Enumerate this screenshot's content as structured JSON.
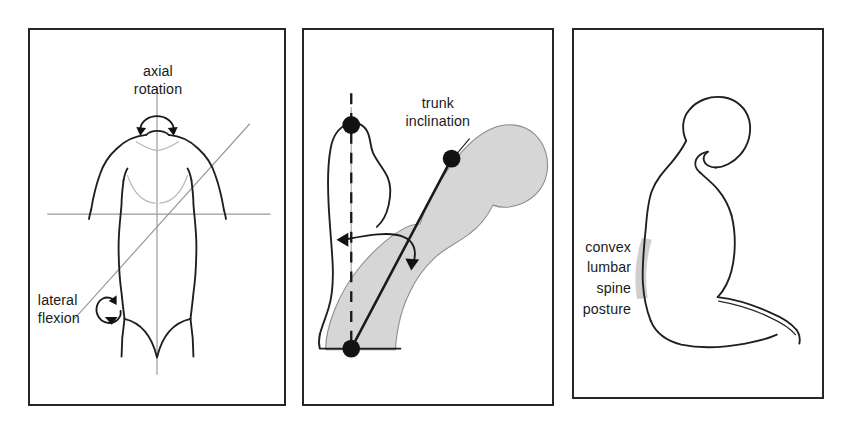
{
  "figure": {
    "name": "trunk-posture-measurement-figure",
    "background_color": "#ffffff",
    "panel_border_color": "#262626",
    "shading_color": "#d6d6d6",
    "line_color": "#1f1f1f",
    "panels": [
      {
        "id": "panel-a",
        "view": "frontal torso with movement axes",
        "labels": [
          {
            "id": "axial-rotation",
            "lines": [
              "axial",
              "rotation"
            ],
            "align": "center"
          },
          {
            "id": "lateral-flexion",
            "lines": [
              "lateral",
              "flexion"
            ],
            "align": "left"
          }
        ]
      },
      {
        "id": "panel-b",
        "view": "sagittal seated trunk with inclination angle",
        "labels": [
          {
            "id": "trunk-inclination",
            "lines": [
              "trunk",
              "inclination"
            ],
            "align": "center"
          }
        ]
      },
      {
        "id": "panel-c",
        "view": "seated side profile showing slumped lumbar spine",
        "labels": [
          {
            "id": "convex-lumbar-spine-posture",
            "lines": [
              "convex",
              "lumbar",
              "spine",
              "posture"
            ],
            "align": "right"
          }
        ]
      }
    ]
  },
  "panel_a": {
    "label_axial_line1": "axial",
    "label_axial_line2": "rotation",
    "label_lateral_line1": "lateral",
    "label_lateral_line2": "flexion"
  },
  "panel_b": {
    "label_trunk_line1": "trunk",
    "label_trunk_line2": "inclination"
  },
  "panel_c": {
    "label_line1": "convex",
    "label_line2": "lumbar",
    "label_line3": "spine",
    "label_line4": "posture"
  }
}
